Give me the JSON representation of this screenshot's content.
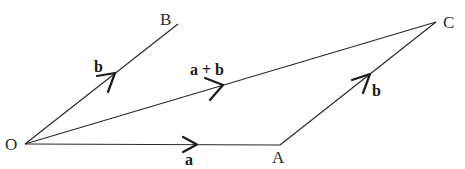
{
  "diagram": {
    "type": "vector-parallelogram",
    "points": {
      "O": {
        "label": "O",
        "x": 25,
        "y": 144
      },
      "A": {
        "label": "A",
        "x": 280,
        "y": 145
      },
      "B": {
        "label": "B",
        "x": 178,
        "y": 24
      },
      "C": {
        "label": "C",
        "x": 436,
        "y": 22
      }
    },
    "vectors": [
      {
        "from": "O",
        "to": "A",
        "label": "a"
      },
      {
        "from": "O",
        "to": "B",
        "label": "b"
      },
      {
        "from": "A",
        "to": "C",
        "label": "b"
      },
      {
        "from": "O",
        "to": "C",
        "label": "a + b"
      }
    ],
    "labels": {
      "point_O": "O",
      "point_A": "A",
      "point_B": "B",
      "point_C": "C",
      "vec_OA": "a",
      "vec_OB": "b",
      "vec_AC": "b",
      "vec_OC": "a + b"
    },
    "colors": {
      "line": "#2a2a2a",
      "background": "#ffffff"
    }
  }
}
